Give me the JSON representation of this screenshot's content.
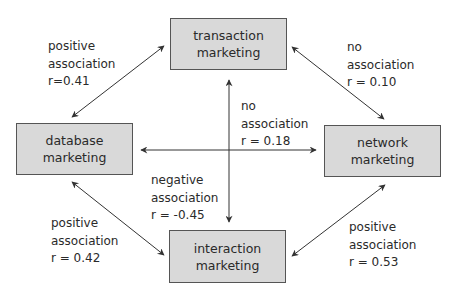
{
  "nodes": {
    "transaction": {
      "line1": "transaction",
      "line2": "marketing"
    },
    "database": {
      "line1": "database",
      "line2": "marketing"
    },
    "network": {
      "line1": "network",
      "line2": "marketing"
    },
    "interaction": {
      "line1": "interaction",
      "line2": "marketing"
    }
  },
  "edges": {
    "database_transaction": {
      "line1": "positive",
      "line2": "association",
      "line3": "r=0.41"
    },
    "transaction_network": {
      "line1": "no",
      "line2": "association",
      "line3": "r = 0.10"
    },
    "database_network": {
      "line1": "no",
      "line2": "association",
      "line3": "r = 0.18"
    },
    "transaction_interaction": {
      "line1": "negative",
      "line2": "association",
      "line3": "r = -0.45"
    },
    "database_interaction": {
      "line1": "positive",
      "line2": "association",
      "line3": "r = 0.42"
    },
    "network_interaction": {
      "line1": "positive",
      "line2": "association",
      "line3": "r = 0.53"
    }
  },
  "colors": {
    "box_fill": "#d9d9d9",
    "box_border": "#555555",
    "arrow": "#333333"
  }
}
